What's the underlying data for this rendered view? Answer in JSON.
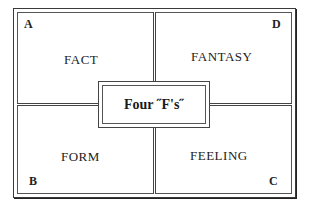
{
  "diagram": {
    "center_title": "Four ˝F's˝",
    "quadrants": [
      {
        "id": "A",
        "label": "FACT",
        "corner": "A",
        "position": "top-left"
      },
      {
        "id": "D",
        "label": "FANTASY",
        "corner": "D",
        "position": "top-right"
      },
      {
        "id": "B",
        "label": "FORM",
        "corner": "B",
        "position": "bottom-left"
      },
      {
        "id": "C",
        "label": "FEELING",
        "corner": "C",
        "position": "bottom-right"
      }
    ]
  }
}
